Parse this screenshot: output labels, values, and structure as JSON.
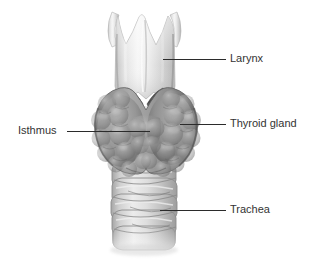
{
  "figure": {
    "background_color": "#ffffff",
    "width": 319,
    "height": 263
  },
  "labels": [
    {
      "id": "larynx",
      "text": "Larynx",
      "side": "right",
      "leader_from": [
        163,
        59
      ],
      "leader_to": [
        226,
        59
      ]
    },
    {
      "id": "thyroid_gland",
      "text": "Thyroid gland",
      "side": "right",
      "leader_from": [
        180,
        124
      ],
      "leader_to": [
        226,
        124
      ]
    },
    {
      "id": "isthmus",
      "text": "Isthmus",
      "side": "left",
      "leader_from": [
        150,
        131
      ],
      "leader_to": [
        67,
        131
      ]
    },
    {
      "id": "trachea",
      "text": "Trachea",
      "side": "right",
      "leader_from": [
        160,
        210
      ],
      "leader_to": [
        226,
        210
      ]
    }
  ],
  "structures": {
    "larynx": {
      "name": "larynx",
      "description": "thyroid cartilage with two superior horns and central notch",
      "fill_light": "#f2f2f2",
      "fill_mid": "#d8d8d8",
      "fill_shadow": "#b0b0b0"
    },
    "thyroid_gland": {
      "name": "thyroid-gland",
      "description": "lobulated bilobed gland with isthmus bridging the two lobes",
      "fill_light": "#a8a8a8",
      "fill_mid": "#8d8d8d",
      "fill_shadow": "#6e6e6e"
    },
    "cricothyroid_muscle": {
      "name": "cricothyroid-muscle",
      "description": "dark striated V-shaped muscle pair above the isthmus",
      "fill": "#545454"
    },
    "trachea": {
      "name": "trachea",
      "description": "stacked cartilage rings descending below the gland",
      "fill_light": "#e4e4e4",
      "fill_mid": "#c9c9c9",
      "fill_shadow": "#9c9c9c",
      "ring_count": 6
    }
  },
  "style": {
    "label_color": "#333333",
    "leader_line_color": "#2b2b2b",
    "leader_line_width": 1
  }
}
